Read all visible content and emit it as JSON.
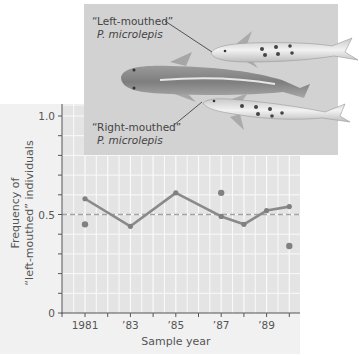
{
  "chart_data": {
    "type": "line",
    "title": "",
    "xlabel": "Sample year",
    "ylabel_lines": [
      "Frequency of",
      "“left-mouthed” individuals"
    ],
    "ylabel": "Frequency of “left-mouthed” individuals",
    "x_ticks": [
      1981,
      1982,
      1983,
      1984,
      1985,
      1986,
      1987,
      1988,
      1989,
      1990
    ],
    "x_tick_labels": [
      "1981",
      "’83",
      "’85",
      "’87",
      "’89"
    ],
    "x_tick_label_years": [
      1981,
      1983,
      1985,
      1987,
      1989
    ],
    "xlim": [
      1980,
      1990.5
    ],
    "y_tick_labels": [
      "0",
      "0.5",
      "1.0"
    ],
    "y_tick_values": [
      0,
      0.5,
      1.0
    ],
    "y_minor_ticks": [
      0.1,
      0.2,
      0.3,
      0.4,
      0.6,
      0.7,
      0.8,
      0.9
    ],
    "ylim": [
      0,
      1.0
    ],
    "grid": true,
    "reference_line": {
      "y": 0.5,
      "style": "dashed"
    },
    "series": [
      {
        "name": "Connected samples",
        "style": "line-with-markers",
        "x": [
          1981,
          1983,
          1985,
          1987,
          1988,
          1989,
          1990
        ],
        "values": [
          0.58,
          0.44,
          0.61,
          0.49,
          0.45,
          0.52,
          0.54
        ]
      },
      {
        "name": "Unconnected samples",
        "style": "markers-only",
        "x": [
          1981,
          1987,
          1990
        ],
        "values": [
          0.45,
          0.61,
          0.34
        ]
      }
    ],
    "annotations": [
      {
        "text": "“Left-mouthed”",
        "subtext": "P. microlepis",
        "target": "upper fish"
      },
      {
        "text": "“Right-mouthed”",
        "subtext": "P. microlepis",
        "target": "lower fish"
      }
    ],
    "legend": "none"
  },
  "photo": {
    "left_label": "“Left-mouthed”",
    "left_species": "P. microlepis",
    "right_label": "“Right-mouthed”",
    "right_species": "P. microlepis"
  },
  "colors": {
    "panel_bg": "#f1f1f1",
    "plot_bg": "#e4e4e4",
    "grid": "#fafafa",
    "line": "#8a8a8a",
    "marker": "#808080",
    "reference": "#a3a3a3",
    "photo_bg": "#d2d2d2",
    "axis": "#555555"
  }
}
